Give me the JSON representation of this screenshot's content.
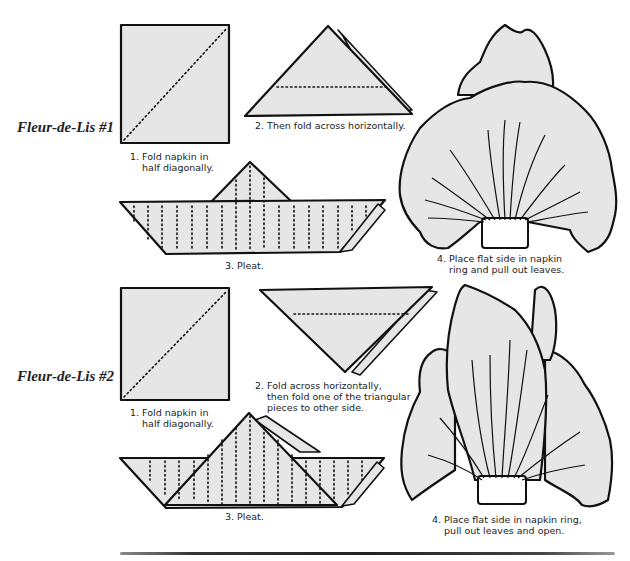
{
  "document": {
    "type": "napkin folding instructions",
    "sections": [
      {
        "title": "Fleur-de-Lis #1",
        "steps": [
          {
            "number": "1.",
            "caption": "1. Fold napkin in\n    half diagonally."
          },
          {
            "number": "2.",
            "caption": "2. Then fold across horizontally."
          },
          {
            "number": "3.",
            "caption": "3. Pleat."
          },
          {
            "number": "4.",
            "caption": "4. Place flat side in napkin\n    ring and pull out leaves."
          }
        ]
      },
      {
        "title": "Fleur-de-Lis #2",
        "steps": [
          {
            "number": "1.",
            "caption": "1. Fold napkin in\n    half diagonally."
          },
          {
            "number": "2.",
            "caption": "2. Fold across horizontally,\n    then fold one of the triangular\n    pieces to other side."
          },
          {
            "number": "3.",
            "caption": "3. Pleat."
          },
          {
            "number": "4.",
            "caption": "4. Place flat side in napkin ring,\n    pull out leaves and open."
          }
        ]
      }
    ]
  },
  "colors": {
    "paper_fill": "#e6e6e6",
    "ink": "#111111",
    "background": "#ffffff"
  }
}
